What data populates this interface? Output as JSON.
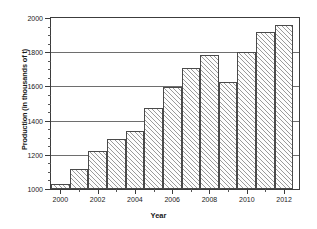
{
  "chart_data": {
    "type": "bar",
    "title": "",
    "xlabel": "Year",
    "ylabel": "Production (in thousands of t)",
    "categories": [
      2000,
      2001,
      2002,
      2003,
      2004,
      2005,
      2006,
      2007,
      2008,
      2009,
      2010,
      2011,
      2012
    ],
    "values": [
      1030,
      1115,
      1220,
      1290,
      1340,
      1475,
      1595,
      1705,
      1785,
      1625,
      1800,
      1920,
      1960
    ],
    "ylim": [
      1000,
      2000
    ],
    "xlim": [
      1999.5,
      2012.8
    ],
    "y_major_ticks": [
      1000,
      1200,
      1400,
      1600,
      1800,
      2000
    ],
    "y_minor_interval": 50,
    "y_tick_labels": [
      "1000",
      "1200",
      "1400",
      "1600",
      "1800",
      "2000"
    ],
    "x_major_ticks": [
      2000,
      2002,
      2004,
      2006,
      2008,
      2010,
      2012
    ],
    "x_tick_labels": [
      "2000",
      "2002",
      "2004",
      "2006",
      "2008",
      "2010",
      "2012"
    ],
    "x_minor_ticks": [
      2001,
      2003,
      2005,
      2007,
      2009,
      2011
    ],
    "grid": "horizontal",
    "legend": null,
    "bar_fill": "diagonal-hatch",
    "bar_edge_color": "#4a4a4a",
    "grid_color": "#6e6e6e",
    "axis_color": "#3c3c3c",
    "background": "#ffffff"
  }
}
